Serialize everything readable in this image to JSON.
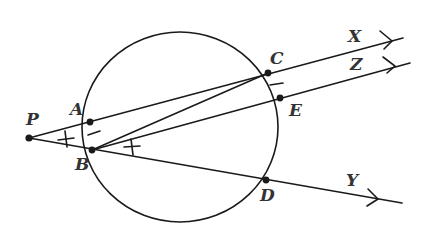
{
  "diagram": {
    "type": "geometry",
    "stroke_color": "#1a1a1a",
    "label_color": "#333333",
    "circle": {
      "cx": 186,
      "cy": 126,
      "r": 96
    },
    "points": {
      "P": {
        "label": "P",
        "x": 29,
        "y": 138
      },
      "A": {
        "label": "A",
        "x": 90,
        "y": 122
      },
      "B": {
        "label": "B",
        "x": 92,
        "y": 150
      },
      "C": {
        "label": "C",
        "x": 268,
        "y": 73
      },
      "E": {
        "label": "E",
        "x": 280,
        "y": 98
      },
      "D": {
        "label": "D",
        "x": 266,
        "y": 180
      }
    },
    "rays": {
      "X": {
        "label": "X",
        "from": "P",
        "through": "C",
        "end": [
          403,
          38
        ]
      },
      "Z": {
        "label": "Z",
        "from": "B",
        "through": "E",
        "end": [
          410,
          63
        ]
      },
      "Y": {
        "label": "Y",
        "from": "P",
        "through": "D",
        "end": [
          402,
          203
        ]
      }
    },
    "segments": [
      {
        "from": "B",
        "to": "C"
      },
      {
        "from": "P",
        "to": "B"
      },
      {
        "from": "P",
        "to": "A"
      }
    ],
    "markings": [
      "angle APB tick mark",
      "angle DBE tick mark",
      "arc AB tick mark",
      "arc CE tick mark"
    ]
  }
}
